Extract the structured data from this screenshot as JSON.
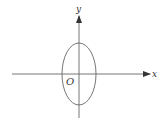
{
  "diagram": {
    "type": "coordinate-plane-with-ellipse",
    "axes": {
      "x_label": "x",
      "y_label": "y",
      "origin_label": "O"
    },
    "ellipse": {
      "center": [
        0,
        0
      ],
      "orientation": "vertical major axis",
      "note": "ellipse centered at origin, taller than wide"
    },
    "colors": {
      "stroke": "#555555",
      "background": "#ffffff"
    }
  }
}
